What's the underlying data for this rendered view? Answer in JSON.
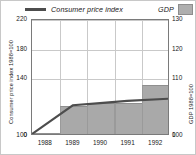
{
  "legend": {
    "cpi": {
      "label": "Consumer price index",
      "marker": "line",
      "color": "#4d4d4d"
    },
    "gdp": {
      "label": "GDP",
      "marker": "swatch",
      "color": "#aeaeae"
    }
  },
  "axes": {
    "left": {
      "title": "Consumer price index 1988=100",
      "ticks": [
        "0",
        "100",
        "140",
        "180",
        "220"
      ]
    },
    "right": {
      "title": "GDP 1988=100",
      "ticks": [
        "0",
        "100",
        "110",
        "120",
        "130"
      ]
    },
    "x": {
      "ticks": [
        "1988",
        "1989",
        "1990",
        "1991",
        "1992"
      ]
    }
  },
  "chart_data": {
    "type": "bar",
    "title": "",
    "xlabel": "",
    "ylabel": "Consumer price index 1988=100",
    "y2label": "GDP 1988=100",
    "categories": [
      "1988",
      "1989",
      "1990",
      "1991",
      "1992"
    ],
    "grid": true,
    "legend_position": "top",
    "note": "Broken y-axis: baseline 0 then scale resumes at 100.",
    "ylim": [
      100,
      220
    ],
    "y2lim": [
      100,
      130
    ],
    "yticks": [
      0,
      100,
      140,
      180,
      220
    ],
    "y2ticks": [
      0,
      100,
      110,
      120,
      130
    ],
    "series": [
      {
        "name": "GDP",
        "type": "bar",
        "axis": "right",
        "color": "#a9a9a9",
        "values": [
          100,
          100.5,
          101.5,
          101.5,
          107.5
        ]
      },
      {
        "name": "Consumer price index",
        "type": "line",
        "axis": "left",
        "color": "#4d4d4d",
        "values": [
          100,
          103,
          106,
          109,
          112
        ]
      }
    ]
  }
}
